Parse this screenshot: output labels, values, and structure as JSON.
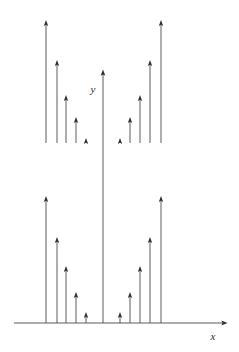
{
  "figure": {
    "title": "",
    "background_color": "#ffffff",
    "stem_color": "#4a4a4a",
    "arrow_color": "#2e2e2e",
    "axis_color": "#5a5a5a",
    "x_axis_label": "x",
    "y_axis_label": "y"
  },
  "chart_data": {
    "type": "bar",
    "title": "",
    "xlabel": "x",
    "ylabel": "y",
    "grid": false,
    "legend": null,
    "axis_baseline_y": 323,
    "upper_band_baseline_y": 143,
    "center_x": 103,
    "x_axis_arrow_tip_x": 225,
    "y_axis_arrow_tip_y": 70,
    "upper_band": {
      "name": "upper impulses",
      "baseline": 143,
      "categories": [
        "-5",
        "-4",
        "-3",
        "-2",
        "-1",
        "1",
        "2",
        "3",
        "4",
        "5"
      ],
      "x_positions": [
        46,
        57,
        66,
        76,
        86,
        120,
        130,
        140,
        150,
        161
      ],
      "tip_y": [
        20,
        60,
        95,
        117,
        138,
        138,
        117,
        95,
        60,
        20
      ],
      "lengths": [
        123,
        83,
        48,
        26,
        5,
        5,
        26,
        48,
        83,
        123
      ]
    },
    "lower_band": {
      "name": "lower impulses",
      "baseline": 323,
      "categories": [
        "-5",
        "-4",
        "-3",
        "-2",
        "-1",
        "1",
        "2",
        "3",
        "4",
        "5"
      ],
      "x_positions": [
        46,
        57,
        66,
        76,
        86,
        120,
        130,
        140,
        150,
        161
      ],
      "tip_y": [
        196,
        237,
        266,
        292,
        312,
        312,
        292,
        266,
        237,
        196
      ],
      "lengths": [
        127,
        86,
        57,
        31,
        11,
        11,
        31,
        57,
        86,
        127
      ]
    },
    "center_impulse": {
      "name": "y-axis impulse",
      "x": 103,
      "baseline": 323,
      "tip_y": 70,
      "length": 253
    }
  }
}
